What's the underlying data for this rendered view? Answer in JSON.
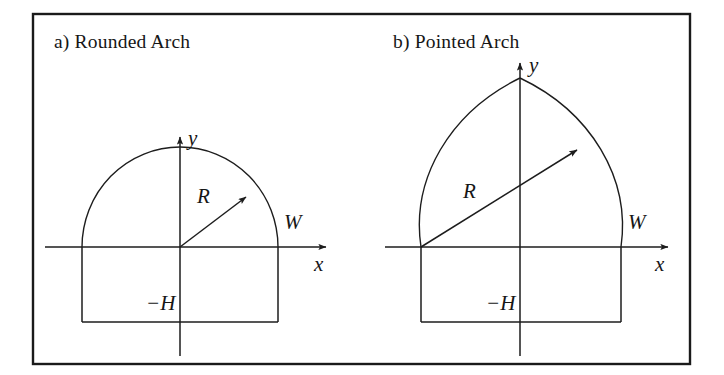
{
  "figure": {
    "background_color": "#ffffff",
    "ink_color": "#1d1d1d",
    "frame": {
      "name": "outer-frame",
      "x": 33,
      "y": 14,
      "width": 657,
      "height": 350,
      "stroke_color": "#1a1a1a"
    }
  },
  "panels": [
    {
      "id": "rounded-arch",
      "title": "a)  Rounded Arch",
      "title_x": 54,
      "title_y": 48,
      "arch_type": "semicircle",
      "origin": {
        "x": 180,
        "y": 247
      },
      "half_width": 98,
      "base_depth": 75,
      "apex": {
        "x": 180,
        "y": 147
      },
      "labels": {
        "y_axis": "y",
        "x_axis": "x",
        "radius": "R",
        "width": "W",
        "depth": "−H"
      },
      "label_positions": {
        "y_axis": {
          "x": 188,
          "y": 145
        },
        "x_axis": {
          "x": 314,
          "y": 271
        },
        "radius": {
          "x": 197,
          "y": 203
        },
        "width": {
          "x": 284,
          "y": 229
        },
        "depth": {
          "x": 146,
          "y": 310
        }
      },
      "axes": {
        "x_start": 45,
        "x_end": 332,
        "y_top": 131,
        "y_bottom": 356
      },
      "radius_arrow": {
        "from": {
          "x": 180,
          "y": 247
        },
        "to": {
          "x": 251,
          "y": 192
        }
      }
    },
    {
      "id": "pointed-arch",
      "title": "b)  Pointed Arch",
      "title_x": 393,
      "title_y": 48,
      "arch_type": "pointed",
      "origin": {
        "x": 520,
        "y": 247
      },
      "half_width": 100,
      "base_depth": 75,
      "apex": {
        "x": 520,
        "y": 78
      },
      "labels": {
        "y_axis": "y",
        "x_axis": "x",
        "radius": "R",
        "width": "W",
        "depth": "−H"
      },
      "label_positions": {
        "y_axis": {
          "x": 529,
          "y": 72
        },
        "x_axis": {
          "x": 655,
          "y": 271
        },
        "radius": {
          "x": 463,
          "y": 198
        },
        "width": {
          "x": 628,
          "y": 229
        },
        "depth": {
          "x": 486,
          "y": 310
        }
      },
      "axes": {
        "x_start": 385,
        "x_end": 674,
        "y_top": 57,
        "y_bottom": 356
      },
      "radius_arrow": {
        "from": {
          "x": 421,
          "y": 247
        },
        "to": {
          "x": 582,
          "y": 146
        }
      }
    }
  ]
}
